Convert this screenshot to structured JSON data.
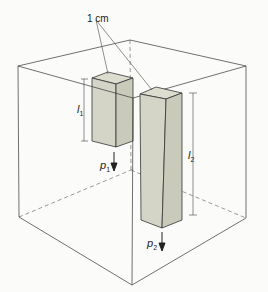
{
  "diagram": {
    "annotation_width": "1 cm",
    "labels": {
      "l1": {
        "base": "l",
        "sub": "1"
      },
      "l2": {
        "base": "l",
        "sub": "2"
      },
      "p1": {
        "base": "p",
        "sub": "1"
      },
      "p2": {
        "base": "p",
        "sub": "2"
      }
    },
    "colors": {
      "line": "#333333",
      "column_fill": "#d4d5c6",
      "column_side": "#c9cab9",
      "column_top": "#dcdccf",
      "background": "#fbfbf9"
    }
  }
}
